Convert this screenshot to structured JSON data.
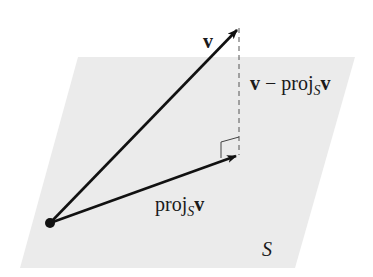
{
  "diagram": {
    "plane": {
      "label": "S",
      "fill": "#ebebeb",
      "points": [
        [
          78,
          57
        ],
        [
          355,
          57
        ],
        [
          295,
          268
        ],
        [
          20,
          268
        ]
      ]
    },
    "origin": {
      "x": 50,
      "y": 223,
      "r": 5
    },
    "vectors": [
      {
        "name": "v",
        "label": "v",
        "from": [
          50,
          223
        ],
        "to": [
          239,
          28
        ]
      },
      {
        "name": "proj",
        "label_main": "proj",
        "label_sub": "S",
        "label_vec": "v",
        "from": [
          50,
          223
        ],
        "to": [
          239,
          155
        ]
      }
    ],
    "perpendicular": {
      "label_v": "v",
      "label_minus": " − proj",
      "label_sub": "S",
      "label_vec": "v",
      "from": [
        239,
        28
      ],
      "to": [
        239,
        155
      ]
    },
    "labels": {
      "v": "v",
      "proj_main": "proj",
      "proj_sub": "S",
      "proj_vec": "v",
      "diff_v": "v",
      "diff_minus": " − proj",
      "diff_sub": "S",
      "diff_vec": "v",
      "plane": "S"
    },
    "colors": {
      "stroke": "#111111",
      "plane": "#ebebeb",
      "dash": "#555555"
    }
  }
}
